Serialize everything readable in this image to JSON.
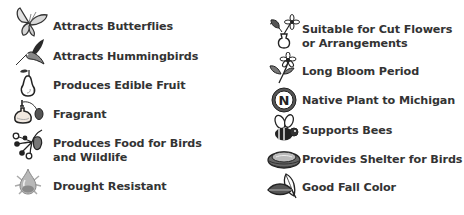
{
  "legend": {
    "left_column": [
      {
        "label": "Attracts Butterflies",
        "icon": "butterfly-icon"
      },
      {
        "label": "Attracts Hummingbirds",
        "icon": "hummingbird-icon"
      },
      {
        "label": "Produces Edible Fruit",
        "icon": "pear-icon"
      },
      {
        "label": "Fragrant",
        "icon": "perfume-bottle-icon"
      },
      {
        "label_line1": "Produces Food for Birds",
        "label_line2": "and Wildlife",
        "icon": "berries-icon"
      },
      {
        "label": "Drought Resistant",
        "icon": "water-drop-icon"
      }
    ],
    "right_column": [
      {
        "label_line1": "Suitable for Cut Flowers",
        "label_line2": "or Arrangements",
        "icon": "flower-vase-icon"
      },
      {
        "label": "Long Bloom Period",
        "icon": "flower-stem-icon"
      },
      {
        "label": "Native Plant to Michigan",
        "icon": "native-n-badge-icon",
        "badge_letter": "N"
      },
      {
        "label": "Supports Bees",
        "icon": "bee-icon"
      },
      {
        "label": "Provides Shelter for Birds",
        "icon": "bird-nest-icon"
      },
      {
        "label": "Good Fall Color",
        "icon": "leaves-icon"
      }
    ]
  },
  "colors": {
    "text": "#333333",
    "icon_dark": "#2a2a2a",
    "icon_mid": "#8a8a8a",
    "icon_light": "#d0d0d0",
    "background": "#ffffff"
  }
}
